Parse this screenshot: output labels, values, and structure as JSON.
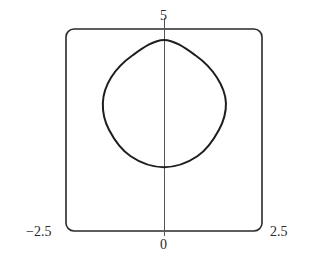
{
  "chart_data": {
    "type": "line",
    "title": "",
    "xlabel": "",
    "ylabel": "",
    "xlim": [
      -2.5,
      2.5
    ],
    "ylim": [
      0,
      5
    ],
    "grid": false,
    "legend": null,
    "tick_labels": {
      "x_min": "−2.5",
      "x_max": "2.5",
      "x_zero": "0",
      "y_max": "5"
    },
    "axes": {
      "vertical_axis_at_x": 0,
      "frame": "rounded-rectangle"
    },
    "series": [
      {
        "name": "closed-curve",
        "description": "Closed convex rounded-diamond-shaped curve centered on the y-axis",
        "points": [
          {
            "x": 0.0,
            "y": 4.73
          },
          {
            "x": 0.8,
            "y": 4.35
          },
          {
            "x": 1.35,
            "y": 3.8
          },
          {
            "x": 1.58,
            "y": 3.17
          },
          {
            "x": 1.4,
            "y": 2.5
          },
          {
            "x": 0.85,
            "y": 1.85
          },
          {
            "x": 0.0,
            "y": 1.58
          },
          {
            "x": -0.85,
            "y": 1.85
          },
          {
            "x": -1.4,
            "y": 2.5
          },
          {
            "x": -1.56,
            "y": 3.17
          },
          {
            "x": -1.35,
            "y": 3.8
          },
          {
            "x": -0.8,
            "y": 4.35
          },
          {
            "x": 0.0,
            "y": 4.73
          }
        ]
      }
    ]
  },
  "colors": {
    "curve": "#1e1e1e",
    "frame": "#2a2a2a",
    "axis": "#555555",
    "background": "#ffffff"
  }
}
